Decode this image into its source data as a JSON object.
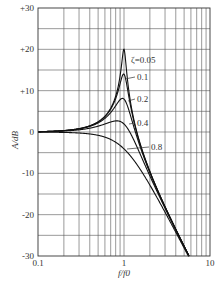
{
  "chart_data": {
    "type": "line",
    "title": "",
    "xlabel": "f/f0",
    "ylabel": "A/dB",
    "xscale": "log",
    "xlim": [
      0.1,
      10
    ],
    "ylim": [
      -30,
      30
    ],
    "grid": true,
    "legend_position": "inline annotations near peak",
    "x_tick_labels": [
      "0.1",
      "1",
      "10"
    ],
    "y_tick_labels": [
      "+30",
      "+20",
      "+10",
      "0",
      "-10",
      "-20",
      "-30"
    ],
    "series": [
      {
        "name": "ζ=0.05",
        "label": "ζ=0.05",
        "zeta": 0.05,
        "peak_db": 20.0
      },
      {
        "name": "0.1",
        "label": "0.1",
        "zeta": 0.1,
        "peak_db": 14.0
      },
      {
        "name": "0.2",
        "label": "0.2",
        "zeta": 0.2,
        "peak_db": 8.1
      },
      {
        "name": "0.4",
        "label": "0.4",
        "zeta": 0.4,
        "peak_db": 2.7
      },
      {
        "name": "0.8",
        "label": "0.8",
        "zeta": 0.8,
        "peak_db": 0.0
      }
    ],
    "formula": "A = -20*log10(sqrt((1-(f/f0)^2)^2 + (2*zeta*f/f0)^2))",
    "sample_points": {
      "x": [
        0.1,
        0.3,
        0.5,
        0.8,
        1.0,
        1.5,
        2,
        3,
        5.4
      ],
      "ζ=0.05": [
        0.09,
        0.83,
        2.49,
        8.5,
        20.0,
        -2.1,
        -9.6,
        -18.1,
        -29.2
      ],
      "0.1": [
        0.09,
        0.82,
        2.43,
        7.2,
        14.0,
        -2.2,
        -9.6,
        -18.1,
        -29.2
      ],
      "0.2": [
        0.08,
        0.77,
        2.2,
        4.9,
        8.0,
        -2.5,
        -9.8,
        -18.2,
        -29.2
      ],
      "0.4": [
        0.07,
        0.59,
        1.39,
        1.6,
        2.0,
        -3.7,
        -10.4,
        -18.4,
        -29.3
      ],
      "0.8": [
        0.03,
        -0.12,
        -1.5,
        -3.6,
        -4.1,
        -7.5,
        -12.5,
        -19.4,
        -29.6
      ]
    }
  }
}
